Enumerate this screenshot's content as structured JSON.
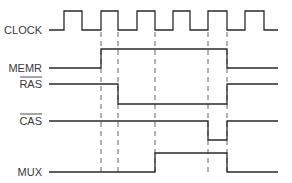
{
  "signals": [
    {
      "name": "CLOCK",
      "active_low": false,
      "levels": [
        0,
        1,
        0,
        1,
        0,
        1,
        0,
        1,
        0,
        1,
        0,
        1,
        0,
        0
      ]
    },
    {
      "name": "MEMR",
      "active_low": false,
      "levels": [
        0,
        0,
        0,
        1,
        1,
        1,
        1,
        1,
        1,
        1,
        0,
        0,
        0,
        0
      ]
    },
    {
      "name": "RAS",
      "active_low": true,
      "levels": [
        1,
        1,
        1,
        1,
        0,
        0,
        0,
        0,
        0,
        0,
        1,
        1,
        1,
        1
      ]
    },
    {
      "name": "CAS",
      "active_low": true,
      "levels": [
        1,
        1,
        1,
        1,
        1,
        1,
        1,
        1,
        1,
        0,
        1,
        1,
        1,
        1
      ]
    },
    {
      "name": "MUX",
      "active_low": false,
      "levels": [
        0,
        0,
        0,
        0,
        0,
        0,
        1,
        1,
        1,
        1,
        0,
        0,
        0,
        0
      ]
    }
  ],
  "time_steps": 14,
  "dashed_markers_at_step": [
    3,
    4,
    6,
    9,
    10
  ]
}
